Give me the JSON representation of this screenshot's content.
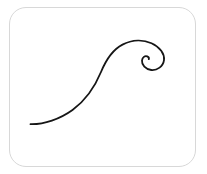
{
  "card": {
    "title": "Wave flourish drawing",
    "background_color": "#ffffff",
    "border_color": "#d8d8d8",
    "border_radius_px": 17,
    "frame": {
      "x": 9,
      "y": 7,
      "width": 187,
      "height": 160
    }
  },
  "artwork": {
    "name": "wave-flourish-stroke",
    "description": "Single continuous calligraphic wave stroke rising from a long low tail into a crest that curls into an inward spiral",
    "stroke_color": "#161616",
    "stroke_width_px": 1.8,
    "fill": "none",
    "linecap": "round",
    "linejoin": "round",
    "path": "M 30.5 124.2 C 44 124.6 60 119.0 72.5 110.0 C 86.5 99.8 95.0 86.5 101.0 72.0 C 106.5 58.6 113.0 49.5 122.5 44.6 C 132.5 39.4 143.5 39.6 151.5 43.2 C 160.0 47.0 164.8 54.0 164.0 60.2 C 163.2 66.4 157.2 70.6 151.2 70.0 C 145.6 69.4 141.6 64.8 142.0 60.6 C 142.3 57.2 145.0 55.4 147.2 56.4 C 148.6 57.0 149.1 58.3 148.8 59.2",
    "bounds": {
      "x_min": 30,
      "y_min": 39,
      "x_max": 165,
      "y_max": 125
    },
    "tail_end_point": {
      "x": 30.5,
      "y": 124.2
    },
    "crest_point": {
      "x": 140,
      "y": 42.5
    },
    "spiral_center": {
      "x": 148,
      "y": 59
    },
    "spiral_terminus": {
      "x": 148.8,
      "y": 59.2
    }
  },
  "viewbox": {
    "width": 207,
    "height": 174
  }
}
